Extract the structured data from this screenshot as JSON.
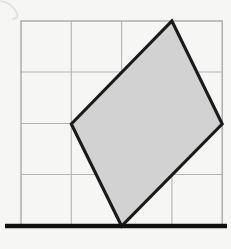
{
  "figure": {
    "background_color": "#f6f6f4",
    "canvas": {
      "width": 231,
      "height": 249
    },
    "grid": {
      "name": "square-grid",
      "columns": 4,
      "rows": 4,
      "cell_size": 50.3,
      "origin_x": 21,
      "origin_y": 21,
      "line_color": "#b3b3b3",
      "border_color": "#a8a8a8",
      "line_width": 1.1,
      "border_width": 1.4,
      "vertical_lines_x": [
        21,
        71.3,
        121.6,
        171.9,
        222.2
      ],
      "horizontal_lines_y": [
        21,
        72,
        123.5,
        174.5,
        226
      ]
    },
    "baseline": {
      "name": "ground-line",
      "x1": 5,
      "y1": 226,
      "x2": 227,
      "y2": 226,
      "color": "#111111",
      "width": 4.4
    },
    "shape": {
      "name": "shaded-quadrilateral",
      "kind": "kite",
      "fill_color": "#d2d2d2",
      "stroke_color": "#1a1a1a",
      "stroke_width": 3.1,
      "points_px": "171.9,21 222.2,124 121.6,226 71.3,124",
      "vertices": [
        {
          "label": "top",
          "grid": [
            3,
            0
          ],
          "px": [
            171.9,
            21
          ]
        },
        {
          "label": "right",
          "grid": [
            4,
            2
          ],
          "px": [
            222.2,
            124
          ]
        },
        {
          "label": "bottom",
          "grid": [
            2,
            4
          ],
          "px": [
            121.6,
            226
          ]
        },
        {
          "label": "left",
          "grid": [
            1,
            2
          ],
          "px": [
            71.3,
            124
          ]
        }
      ]
    },
    "artifact": {
      "name": "scan-smudge",
      "color": "#dcdcdc",
      "path": "M 1 1 Q 12 3 17 13 Q 19 18 13 19"
    }
  }
}
